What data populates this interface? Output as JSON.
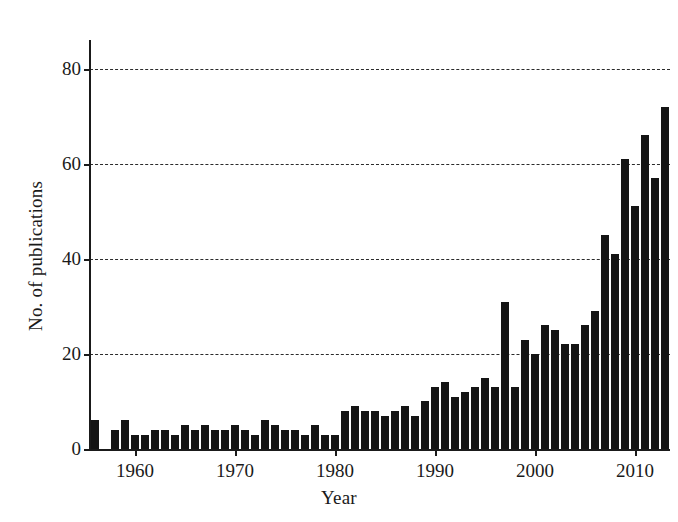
{
  "chart_data": {
    "type": "bar",
    "title": "",
    "xlabel": "Year",
    "ylabel": "No. of publications",
    "xlim": [
      1955.2,
      1956.6
    ],
    "ylim": [
      0,
      86
    ],
    "ytick_values": [
      0,
      20,
      40,
      60,
      80
    ],
    "ytick_labels": [
      "0",
      "20",
      "40",
      "60",
      "80"
    ],
    "xtick_values": [
      1960,
      1970,
      1980,
      1990,
      2000,
      2010
    ],
    "xtick_labels": [
      "1960",
      "1970",
      "1980",
      "1990",
      "2000",
      "2010"
    ],
    "grid": "horizontal-dashed",
    "legend": "none",
    "bar_color": "#141414",
    "background_color": "#ffffff",
    "categories": [
      1956,
      1957,
      1958,
      1959,
      1960,
      1961,
      1962,
      1963,
      1964,
      1965,
      1966,
      1967,
      1968,
      1969,
      1970,
      1971,
      1972,
      1973,
      1974,
      1975,
      1976,
      1977,
      1978,
      1979,
      1980,
      1981,
      1982,
      1983,
      1984,
      1985,
      1986,
      1987,
      1988,
      1989,
      1990,
      1991,
      1992,
      1993,
      1994,
      1995,
      1996,
      1997,
      1998,
      1999,
      2000,
      2001,
      2002,
      2003,
      2004,
      2005,
      2006,
      2007,
      2008,
      2009,
      2010,
      2011,
      2012,
      2013
    ],
    "values": [
      6,
      0,
      4,
      6,
      3,
      3,
      4,
      4,
      3,
      5,
      4,
      5,
      4,
      4,
      5,
      4,
      3,
      6,
      5,
      4,
      4,
      3,
      5,
      3,
      3,
      8,
      9,
      8,
      8,
      7,
      8,
      9,
      7,
      10,
      13,
      14,
      11,
      12,
      13,
      15,
      13,
      31,
      13,
      23,
      20,
      26,
      25,
      22,
      22,
      26,
      29,
      45,
      41,
      61,
      51,
      66,
      57,
      72
    ]
  },
  "axis": {
    "ylabel": "No. of publications",
    "xlabel": "Year"
  }
}
